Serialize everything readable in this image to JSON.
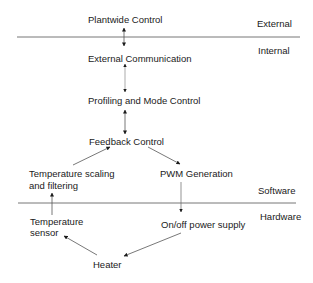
{
  "layers": {
    "external": "External",
    "internal": "Internal",
    "software": "Software",
    "hardware": "Hardware"
  },
  "nodes": {
    "plantwide": "Plantwide   Control",
    "ext_comm": "External Communication",
    "profiling": "Profiling and Mode Control",
    "feedback": "Feedback Control",
    "temp_scaling_1": "Temperature scaling",
    "temp_scaling_2": "and filtering",
    "pwm": "PWM Generation",
    "temp_sensor_1": "Temperature",
    "temp_sensor_2": "sensor",
    "power_supply": "On/off power supply",
    "heater": "Heater"
  },
  "edges": [
    {
      "from": "Plantwide Control",
      "to": "External Communication",
      "type": "bidirectional"
    },
    {
      "from": "External Communication",
      "to": "Profiling and Mode Control",
      "type": "bidirectional"
    },
    {
      "from": "Profiling and Mode Control",
      "to": "Feedback Control",
      "type": "bidirectional"
    },
    {
      "from": "Temperature scaling and filtering",
      "to": "Feedback Control",
      "type": "directed"
    },
    {
      "from": "Feedback Control",
      "to": "PWM Generation",
      "type": "directed"
    },
    {
      "from": "PWM Generation",
      "to": "On/off power supply",
      "type": "directed"
    },
    {
      "from": "On/off power supply",
      "to": "Heater",
      "type": "directed"
    },
    {
      "from": "Heater",
      "to": "Temperature sensor",
      "type": "directed"
    },
    {
      "from": "Temperature sensor",
      "to": "Temperature scaling and filtering",
      "type": "directed"
    }
  ],
  "colors": {
    "line": "#555555",
    "text": "#1a1a1a",
    "background": "#ffffff"
  }
}
